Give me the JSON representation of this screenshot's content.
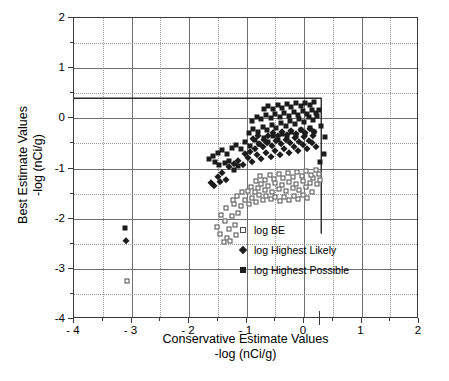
{
  "chart_data": {
    "type": "scatter",
    "title": "",
    "xlabel": "Conservative Estimate Values\n-log (nCi/g)",
    "xlabel_line1": "Conservative Estimate Values",
    "xlabel_line2": "-log (nCi/g)",
    "ylabel_line1": "Best Estimate Values",
    "ylabel_line2": "-log (nCi/g)",
    "xlim": [
      -4,
      2
    ],
    "ylim": [
      -4,
      2
    ],
    "xticks": [
      -4,
      -3,
      -2,
      -1,
      0,
      1,
      2
    ],
    "yticks": [
      -4,
      -3,
      -2,
      -1,
      0,
      1,
      2
    ],
    "xticklabels": [
      "- 4",
      "- 3",
      "- 2",
      "- 1",
      "0",
      "1",
      "2"
    ],
    "yticklabels": [
      "-4",
      "-3",
      "-2",
      "-1",
      "0",
      "1",
      "2"
    ],
    "minor_tick_step": 0.5,
    "grid": true,
    "grid_major_color": "#6f6f6f",
    "grid_minor_color": "#b9b9b9",
    "legend_position": "lower right",
    "marker_color": "#1c1c1c",
    "open_marker_edge": "#4a4a4a",
    "reference_line": {
      "color": "#2a2a2a",
      "points": [
        [
          -4,
          0.4
        ],
        [
          0.3,
          0.4
        ],
        [
          0.3,
          -2.3
        ]
      ]
    },
    "axis_bottom_tick_mark": {
      "x": 0.28
    },
    "series": [
      {
        "name": "log BE",
        "marker": "open-square",
        "points": [
          [
            -3.08,
            -3.25
          ],
          [
            -1.52,
            -2.17
          ],
          [
            -1.46,
            -2.3
          ],
          [
            -1.38,
            -2.05
          ],
          [
            -1.3,
            -2.2
          ],
          [
            -1.26,
            -1.95
          ],
          [
            -1.2,
            -2.12
          ],
          [
            -1.14,
            -1.88
          ],
          [
            -1.36,
            -1.78
          ],
          [
            -1.22,
            -1.7
          ],
          [
            -1.1,
            -1.74
          ],
          [
            -1.02,
            -1.62
          ],
          [
            -0.96,
            -1.7
          ],
          [
            -0.9,
            -1.58
          ],
          [
            -0.84,
            -1.66
          ],
          [
            -0.78,
            -1.52
          ],
          [
            -0.72,
            -1.62
          ],
          [
            -0.98,
            -1.44
          ],
          [
            -0.92,
            -1.36
          ],
          [
            -0.86,
            -1.46
          ],
          [
            -0.8,
            -1.38
          ],
          [
            -0.74,
            -1.3
          ],
          [
            -0.68,
            -1.42
          ],
          [
            -0.62,
            -1.34
          ],
          [
            -0.56,
            -1.46
          ],
          [
            -0.5,
            -1.28
          ],
          [
            -0.44,
            -1.4
          ],
          [
            -0.38,
            -1.32
          ],
          [
            -0.32,
            -1.44
          ],
          [
            -0.26,
            -1.26
          ],
          [
            -0.2,
            -1.38
          ],
          [
            -0.14,
            -1.3
          ],
          [
            -0.08,
            -1.42
          ],
          [
            -0.02,
            -1.24
          ],
          [
            0.04,
            -1.36
          ],
          [
            0.1,
            -1.28
          ],
          [
            0.16,
            -1.18
          ],
          [
            0.22,
            -1.3
          ],
          [
            0.26,
            -1.1
          ],
          [
            0.28,
            -1.22
          ],
          [
            0.2,
            -1.02
          ],
          [
            0.12,
            -1.12
          ],
          [
            0.04,
            -1.04
          ],
          [
            -0.04,
            -1.14
          ],
          [
            -0.12,
            -1.06
          ],
          [
            -0.2,
            -1.16
          ],
          [
            -0.28,
            -1.08
          ],
          [
            -0.36,
            -1.18
          ],
          [
            -0.44,
            -1.1
          ],
          [
            -0.52,
            -1.2
          ],
          [
            -0.6,
            -1.12
          ],
          [
            -0.68,
            -1.22
          ],
          [
            -0.76,
            -1.14
          ],
          [
            -0.84,
            -1.24
          ],
          [
            -0.66,
            -1.54
          ],
          [
            -0.58,
            -1.6
          ],
          [
            -0.5,
            -1.56
          ],
          [
            -0.42,
            -1.64
          ],
          [
            -0.34,
            -1.56
          ],
          [
            -0.26,
            -1.62
          ],
          [
            -0.18,
            -1.54
          ],
          [
            -0.1,
            -1.6
          ],
          [
            -0.02,
            -1.52
          ],
          [
            0.06,
            -1.58
          ],
          [
            0.14,
            -1.46
          ],
          [
            -1.44,
            -1.92
          ],
          [
            -1.34,
            -2.38
          ],
          [
            -1.28,
            -2.44
          ],
          [
            -1.18,
            -2.32
          ],
          [
            -1.4,
            -2.46
          ],
          [
            -1.24,
            -1.62
          ],
          [
            -1.16,
            -1.54
          ],
          [
            -1.08,
            -1.46
          ]
        ]
      },
      {
        "name": "log Highest Likely",
        "marker": "diamond",
        "points": [
          [
            -3.1,
            -2.45
          ],
          [
            -1.62,
            -1.28
          ],
          [
            -1.42,
            -1.08
          ],
          [
            -1.56,
            -1.34
          ],
          [
            -1.5,
            -1.16
          ],
          [
            -1.3,
            -0.98
          ],
          [
            -1.22,
            -0.92
          ],
          [
            -1.14,
            -0.86
          ],
          [
            -1.06,
            -0.94
          ],
          [
            -0.98,
            -0.8
          ],
          [
            -0.9,
            -0.88
          ],
          [
            -0.82,
            -0.74
          ],
          [
            -0.74,
            -0.82
          ],
          [
            -0.66,
            -0.7
          ],
          [
            -0.58,
            -0.78
          ],
          [
            -0.5,
            -0.66
          ],
          [
            -0.42,
            -0.74
          ],
          [
            -0.34,
            -0.62
          ],
          [
            -0.26,
            -0.7
          ],
          [
            -0.18,
            -0.58
          ],
          [
            -0.1,
            -0.66
          ],
          [
            -0.02,
            -0.54
          ],
          [
            0.06,
            -0.62
          ],
          [
            0.14,
            -0.5
          ],
          [
            0.2,
            -0.58
          ],
          [
            -0.72,
            -0.58
          ],
          [
            -0.64,
            -0.5
          ],
          [
            -0.56,
            -0.56
          ],
          [
            -0.48,
            -0.46
          ],
          [
            -0.4,
            -0.52
          ],
          [
            -0.32,
            -0.44
          ],
          [
            -0.24,
            -0.5
          ],
          [
            -0.16,
            -0.4
          ],
          [
            -0.08,
            -0.48
          ],
          [
            0.0,
            -0.38
          ],
          [
            0.08,
            -0.46
          ],
          [
            0.16,
            -0.36
          ],
          [
            -0.86,
            -0.62
          ],
          [
            -0.78,
            -0.52
          ],
          [
            -0.7,
            -0.44
          ],
          [
            -0.62,
            -0.36
          ],
          [
            -0.54,
            -0.3
          ],
          [
            -0.46,
            -0.36
          ],
          [
            -0.38,
            -0.28
          ],
          [
            -0.3,
            -0.34
          ],
          [
            -0.22,
            -0.26
          ],
          [
            -0.14,
            -0.32
          ],
          [
            -0.06,
            -0.24
          ],
          [
            0.02,
            -0.3
          ],
          [
            0.1,
            -0.22
          ],
          [
            0.18,
            -0.28
          ],
          [
            -0.94,
            -0.68
          ],
          [
            -1.02,
            -0.72
          ],
          [
            -0.88,
            -0.42
          ],
          [
            -0.8,
            -0.36
          ],
          [
            -1.36,
            -1.22
          ],
          [
            -1.46,
            -1.26
          ]
        ]
      },
      {
        "name": "log Highest Possible",
        "marker": "filled-square",
        "points": [
          [
            -3.12,
            -2.18
          ],
          [
            -1.66,
            -0.82
          ],
          [
            -1.58,
            -0.76
          ],
          [
            -1.5,
            -0.7
          ],
          [
            -1.42,
            -0.64
          ],
          [
            -1.34,
            -0.72
          ],
          [
            -1.26,
            -0.6
          ],
          [
            -1.18,
            -0.54
          ],
          [
            -1.1,
            -0.62
          ],
          [
            -1.02,
            -0.48
          ],
          [
            -0.94,
            -0.56
          ],
          [
            -0.86,
            -0.44
          ],
          [
            -0.78,
            -0.52
          ],
          [
            -0.7,
            -0.4
          ],
          [
            -0.62,
            -0.48
          ],
          [
            -0.54,
            -0.36
          ],
          [
            -0.46,
            -0.44
          ],
          [
            -0.38,
            -0.32
          ],
          [
            -0.3,
            -0.4
          ],
          [
            -0.22,
            -0.28
          ],
          [
            -0.14,
            -0.36
          ],
          [
            -0.06,
            -0.24
          ],
          [
            0.02,
            -0.32
          ],
          [
            0.1,
            -0.2
          ],
          [
            0.18,
            -0.28
          ],
          [
            -0.96,
            -0.3
          ],
          [
            -0.88,
            -0.22
          ],
          [
            -0.8,
            -0.28
          ],
          [
            -0.72,
            -0.18
          ],
          [
            -0.64,
            -0.24
          ],
          [
            -0.56,
            -0.14
          ],
          [
            -0.48,
            -0.2
          ],
          [
            -0.4,
            -0.1
          ],
          [
            -0.32,
            -0.16
          ],
          [
            -0.24,
            -0.06
          ],
          [
            -0.16,
            -0.12
          ],
          [
            -0.08,
            -0.02
          ],
          [
            0.0,
            -0.08
          ],
          [
            0.08,
            0.02
          ],
          [
            0.16,
            -0.04
          ],
          [
            0.22,
            0.04
          ],
          [
            -0.9,
            -0.06
          ],
          [
            -0.82,
            0.02
          ],
          [
            -0.74,
            -0.02
          ],
          [
            -0.66,
            0.06
          ],
          [
            -0.58,
            0.0
          ],
          [
            -0.5,
            0.08
          ],
          [
            -0.42,
            0.02
          ],
          [
            -0.34,
            0.1
          ],
          [
            -0.26,
            0.04
          ],
          [
            -0.18,
            0.12
          ],
          [
            -0.1,
            0.06
          ],
          [
            -0.02,
            0.14
          ],
          [
            0.06,
            0.08
          ],
          [
            0.14,
            0.16
          ],
          [
            0.2,
            0.1
          ],
          [
            0.26,
            0.16
          ],
          [
            -0.7,
            0.18
          ],
          [
            -0.62,
            0.24
          ],
          [
            -0.54,
            0.18
          ],
          [
            -0.46,
            0.26
          ],
          [
            -0.38,
            0.2
          ],
          [
            -0.3,
            0.28
          ],
          [
            -0.22,
            0.22
          ],
          [
            -0.14,
            0.3
          ],
          [
            -0.06,
            0.24
          ],
          [
            0.02,
            0.3
          ],
          [
            0.1,
            0.26
          ],
          [
            0.18,
            0.32
          ],
          [
            0.3,
            -0.16
          ],
          [
            0.36,
            -0.38
          ],
          [
            0.34,
            -0.72
          ],
          [
            0.28,
            -0.88
          ],
          [
            -1.54,
            -0.88
          ],
          [
            -1.48,
            -0.94
          ],
          [
            -1.22,
            -1.02
          ],
          [
            -1.14,
            -0.96
          ],
          [
            -1.3,
            -0.86
          ],
          [
            -1.38,
            -0.9
          ]
        ]
      }
    ]
  },
  "legend": {
    "items": [
      {
        "label": "log BE",
        "marker": "open-square"
      },
      {
        "label": "log Highest Likely",
        "marker": "diamond"
      },
      {
        "label": "log Highest Possible",
        "marker": "filled-square"
      }
    ]
  }
}
